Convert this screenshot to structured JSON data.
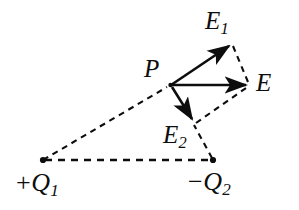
{
  "figure": {
    "background_color": "#ffffff",
    "stroke_color": "#0d0d0d",
    "labels": {
      "field_total": "E",
      "field_from_q1": "E",
      "field_from_q1_sub": "1",
      "field_from_q2": "E",
      "field_from_q2_sub": "2",
      "point": "P",
      "charge_positive_sign": "+",
      "charge_positive": "Q",
      "charge_positive_sub": "1",
      "charge_negative_sign": "−",
      "charge_negative": "Q",
      "charge_negative_sub": "2"
    },
    "points": {
      "P": {
        "x": 170,
        "y": 85
      },
      "Q1": {
        "x": 43,
        "y": 160
      },
      "Q2": {
        "x": 213,
        "y": 160
      },
      "E_tip": {
        "x": 248,
        "y": 85
      },
      "E1_tip": {
        "x": 231,
        "y": 43
      },
      "E2_tip": {
        "x": 193,
        "y": 122
      }
    },
    "vectors": [
      {
        "name": "E1",
        "from": "P",
        "to": "E1_tip",
        "style": "solid-arrow"
      },
      {
        "name": "E",
        "from": "P",
        "to": "E_tip",
        "style": "solid-arrow"
      },
      {
        "name": "E2",
        "from": "P",
        "to": "E2_tip",
        "style": "solid-arrow"
      }
    ],
    "construction_lines": [
      {
        "name": "Q1-to-P",
        "from": "Q1",
        "to": "P",
        "style": "dashed"
      },
      {
        "name": "Q1-to-Q2",
        "from": "Q1",
        "to": "Q2",
        "style": "dashed"
      },
      {
        "name": "Q2-to-E2tip",
        "from": "Q2",
        "to": "E2_tip",
        "style": "dashed"
      },
      {
        "name": "E1tip-to-Etip",
        "from": "E1_tip",
        "to": "E_tip",
        "style": "dashed"
      },
      {
        "name": "E2tip-to-Etip",
        "from": "E2_tip",
        "to": "E_tip",
        "style": "dashed"
      }
    ]
  }
}
